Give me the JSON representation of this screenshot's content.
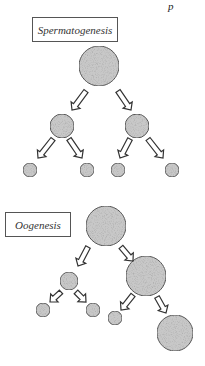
{
  "page_mark": "p",
  "spermatogenesis": {
    "label": "Spermatogenesis",
    "cells": [
      {
        "id": "sp-primary",
        "cx": 99,
        "cy": 66,
        "r": 20
      },
      {
        "id": "sp-secondary-left",
        "cx": 62,
        "cy": 126,
        "r": 12
      },
      {
        "id": "sp-secondary-right",
        "cx": 137,
        "cy": 126,
        "r": 12
      },
      {
        "id": "sp-spermatid-1",
        "cx": 30,
        "cy": 170,
        "r": 7
      },
      {
        "id": "sp-spermatid-2",
        "cx": 87,
        "cy": 170,
        "r": 7
      },
      {
        "id": "sp-spermatid-3",
        "cx": 118,
        "cy": 170,
        "r": 7
      },
      {
        "id": "sp-spermatid-4",
        "cx": 172,
        "cy": 170,
        "r": 7
      }
    ],
    "arrows": [
      {
        "x1": 86,
        "y1": 91,
        "x2": 72,
        "y2": 110
      },
      {
        "x1": 118,
        "y1": 91,
        "x2": 131,
        "y2": 110
      },
      {
        "x1": 53,
        "y1": 139,
        "x2": 38,
        "y2": 158
      },
      {
        "x1": 69,
        "y1": 139,
        "x2": 82,
        "y2": 158
      },
      {
        "x1": 130,
        "y1": 139,
        "x2": 120,
        "y2": 158
      },
      {
        "x1": 148,
        "y1": 139,
        "x2": 163,
        "y2": 158
      }
    ]
  },
  "oogenesis": {
    "label": "Oogenesis",
    "cells": [
      {
        "id": "oo-primary",
        "cx": 106,
        "cy": 226,
        "r": 20
      },
      {
        "id": "oo-polar-body-1",
        "cx": 69,
        "cy": 281,
        "r": 9
      },
      {
        "id": "oo-secondary-oocyte",
        "cx": 146,
        "cy": 276,
        "r": 20
      },
      {
        "id": "oo-polar-body-2a",
        "cx": 43,
        "cy": 310,
        "r": 7
      },
      {
        "id": "oo-polar-body-2b",
        "cx": 93,
        "cy": 310,
        "r": 7
      },
      {
        "id": "oo-polar-body-2c",
        "cx": 115,
        "cy": 318,
        "r": 7
      },
      {
        "id": "oo-ovum",
        "cx": 175,
        "cy": 333,
        "r": 18
      }
    ],
    "arrows": [
      {
        "x1": 88,
        "y1": 247,
        "x2": 78,
        "y2": 266
      },
      {
        "x1": 121,
        "y1": 247,
        "x2": 133,
        "y2": 261
      },
      {
        "x1": 61,
        "y1": 292,
        "x2": 50,
        "y2": 302
      },
      {
        "x1": 76,
        "y1": 292,
        "x2": 86,
        "y2": 302
      },
      {
        "x1": 133,
        "y1": 295,
        "x2": 121,
        "y2": 310
      },
      {
        "x1": 157,
        "y1": 297,
        "x2": 166,
        "y2": 313
      }
    ]
  },
  "colors": {
    "cell_fill": "#c8c8c8",
    "cell_stroke": "#555555",
    "arrow_stroke": "#333333",
    "box_border": "#555555"
  }
}
